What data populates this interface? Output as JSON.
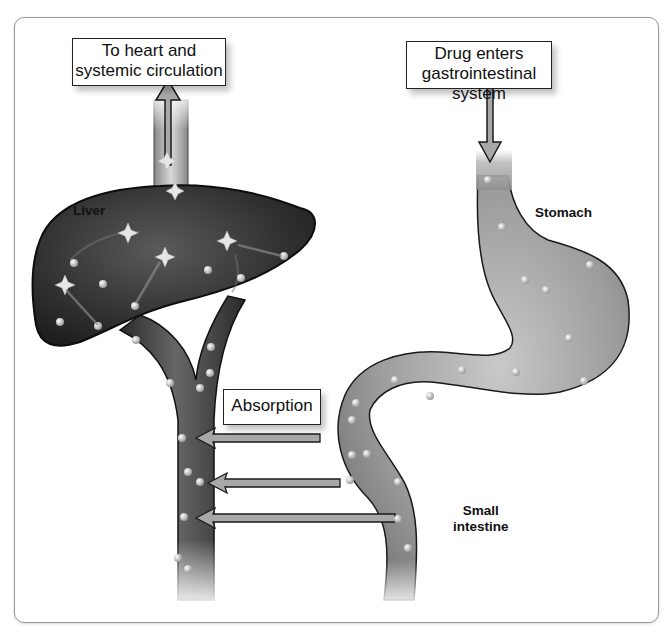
{
  "diagram": {
    "callouts": {
      "heart": {
        "lines": [
          "To heart and",
          "systemic circulation"
        ]
      },
      "entry": {
        "lines": [
          "Drug enters",
          "gastrointestinal system"
        ]
      },
      "absorption": {
        "text": "Absorption"
      }
    },
    "labels": {
      "liver": "Liver",
      "stomach": "Stomach",
      "small_intestine": [
        "Small",
        "intestine"
      ]
    },
    "arrows": {
      "up_to_heart": "up",
      "down_into_stomach": "down",
      "absorption_count": 3,
      "absorption_direction": "left"
    },
    "colors": {
      "liver": "#2e2e2e",
      "vessel": "#3a3a3a",
      "gi_tract": "#9a9a9a",
      "arrow_fill": "#a8a8a8",
      "outline": "#1a1a1a"
    }
  }
}
